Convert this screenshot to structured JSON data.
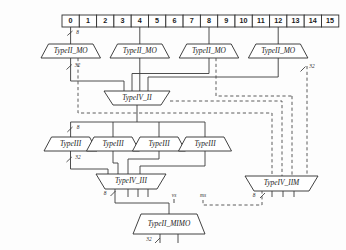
{
  "diagram": {
    "colors": {
      "line": "#3a3a3a",
      "shape_stroke": "#2e2e2e",
      "shape_fill": "#ffffff",
      "background": "#fdfdfd",
      "text": "#1b1b1b"
    },
    "register_bar": {
      "name": "index-register-bar",
      "cells": [
        "0",
        "1",
        "2",
        "3",
        "4",
        "5",
        "6",
        "7",
        "8",
        "9",
        "10",
        "11",
        "12",
        "13",
        "14",
        "15"
      ]
    },
    "row_typeii_mo": [
      {
        "label": "TypeII_MO"
      },
      {
        "label": "TypeII_MO"
      },
      {
        "label": "TypeII_MO"
      },
      {
        "label": "TypeII_MO"
      }
    ],
    "merge_typeiv_ii": {
      "label": "TypeIV_II"
    },
    "row_typeiii": [
      {
        "label": "TypeIII"
      },
      {
        "label": "TypeIII"
      },
      {
        "label": "TypeIII"
      },
      {
        "label": "TypeIII"
      }
    ],
    "merge_typeiv_iii": {
      "label": "TypeIV_III"
    },
    "merge_typeiv_iim": {
      "label": "TypeIV_IIM"
    },
    "output_typeii_mimo": {
      "label": "TypeII_MIMO"
    },
    "width_labels": {
      "top_in": "8",
      "mo_out": "32",
      "mo_out_right": "32",
      "typeiii_in": "8",
      "typeiii_out": "32",
      "typeiv_iii_out": "8",
      "typeiv_iim_out": "8",
      "mimo_out": "32",
      "signal_vs": "vs",
      "signal_ms": "ms"
    }
  }
}
